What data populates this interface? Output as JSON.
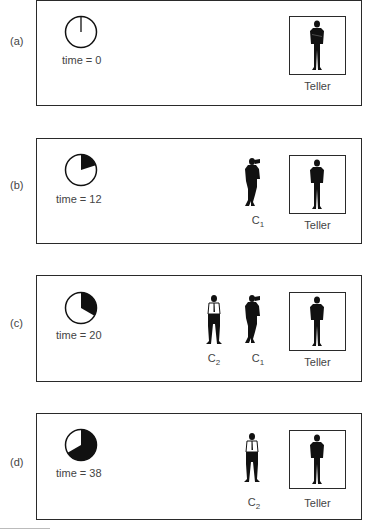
{
  "panels": [
    {
      "label": "(a)",
      "time_label": "time = 0",
      "time": 0,
      "pie_fraction": 0.0,
      "queue": [],
      "teller_label": "Teller"
    },
    {
      "label": "(b)",
      "time_label": "time = 12",
      "time": 12,
      "pie_fraction": 0.2,
      "queue": [
        {
          "name": "C",
          "sub": "1"
        }
      ],
      "teller_label": "Teller"
    },
    {
      "label": "(c)",
      "time_label": "time = 20",
      "time": 20,
      "pie_fraction": 0.3333,
      "queue": [
        {
          "name": "C",
          "sub": "2"
        },
        {
          "name": "C",
          "sub": "1"
        }
      ],
      "teller_label": "Teller"
    },
    {
      "label": "(d)",
      "time_label": "time = 38",
      "time": 38,
      "pie_fraction": 0.6333,
      "queue": [
        {
          "name": "C",
          "sub": "2"
        }
      ],
      "teller_label": "Teller"
    }
  ],
  "colors": {
    "frame": "#2a2a2a",
    "fill": "#111111",
    "text": "#444444"
  }
}
